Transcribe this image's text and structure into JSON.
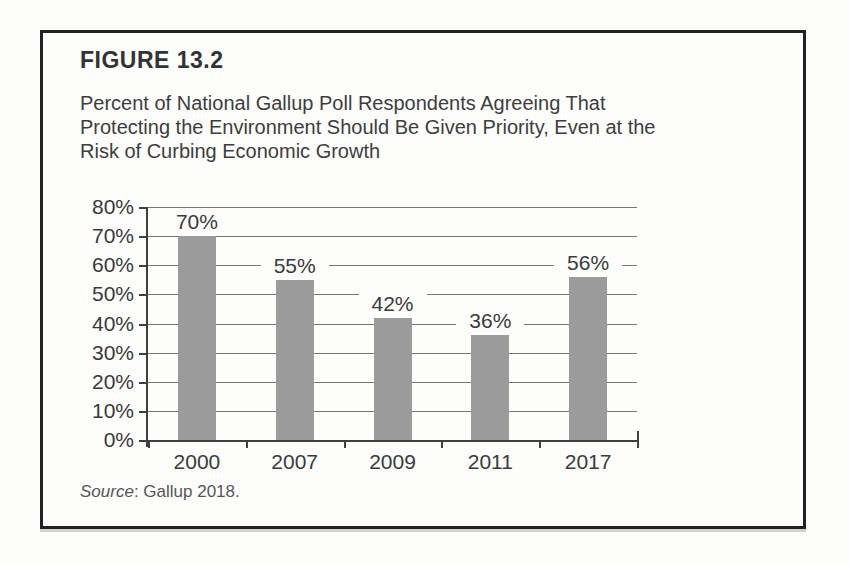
{
  "figure": {
    "label": "FIGURE 13.2",
    "caption_lines": [
      "Percent of National Gallup Poll Respondents Agreeing That",
      "Protecting the Environment Should Be Given Priority, Even at the",
      "Risk of Curbing Economic Growth"
    ],
    "source": {
      "prefix": "Source",
      "rest": ": Gallup 2018."
    }
  },
  "chart_data": {
    "type": "bar",
    "categories": [
      "2000",
      "2007",
      "2009",
      "2011",
      "2017"
    ],
    "values": [
      70,
      55,
      42,
      36,
      56
    ],
    "unit": "%",
    "title": "",
    "xlabel": "",
    "ylabel": "",
    "ylim": [
      0,
      80
    ],
    "y_tick_step": 10,
    "grid": true,
    "legend": false,
    "data_labels": true,
    "bar_color": "#9b9b9b",
    "grid_color": "#777777",
    "axis_color": "#3f3f3f",
    "label_color": "#3a3a3a"
  }
}
